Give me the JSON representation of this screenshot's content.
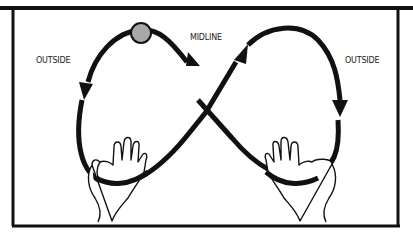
{
  "diagram": {
    "labels": {
      "left": "OUTSIDE",
      "center": "MIDLINE",
      "right": "OUTSIDE"
    },
    "colors": {
      "stroke": "#111111",
      "ball": "#a8a8a8",
      "background": "#ffffff"
    },
    "elements": [
      "ball",
      "left-hand",
      "right-hand",
      "figure-eight-path",
      "direction-arrows"
    ]
  }
}
